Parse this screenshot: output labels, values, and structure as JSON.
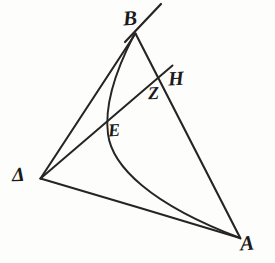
{
  "figure": {
    "kind": "geometry-diagram",
    "background_color": "#fdfdfc",
    "ink_color": "#262523",
    "labels": {
      "B": "B",
      "H": "H",
      "Z": "Z",
      "E": "E",
      "Delta": "Δ",
      "A": "A"
    },
    "points": [
      {
        "name": "B",
        "label": "B",
        "x": 136,
        "y": 33
      },
      {
        "name": "H",
        "label": "H",
        "x": 172,
        "y": 66
      },
      {
        "name": "Z",
        "label": "Z",
        "x": 160,
        "y": 80
      },
      {
        "name": "E",
        "label": "E",
        "x": 112,
        "y": 132
      },
      {
        "name": "Delta",
        "label": "Δ",
        "x": 40,
        "y": 178
      },
      {
        "name": "A",
        "label": "A",
        "x": 240,
        "y": 238
      }
    ],
    "segments": [
      {
        "name": "segment-delta-b",
        "from": "Delta",
        "to": "B"
      },
      {
        "name": "segment-delta-a",
        "from": "Delta",
        "to": "A"
      },
      {
        "name": "segment-b-a",
        "from": "B",
        "to": "A",
        "through": "Z"
      },
      {
        "name": "segment-delta-h",
        "from": "Delta",
        "to": "H",
        "through": "E, Z"
      },
      {
        "name": "segment-h-extension",
        "from": "H",
        "to": "beyond-B"
      }
    ],
    "curves": [
      {
        "name": "curve-b-e-a",
        "from": "B",
        "to": "A",
        "through": "E",
        "shape": "concave-arc"
      }
    ]
  }
}
